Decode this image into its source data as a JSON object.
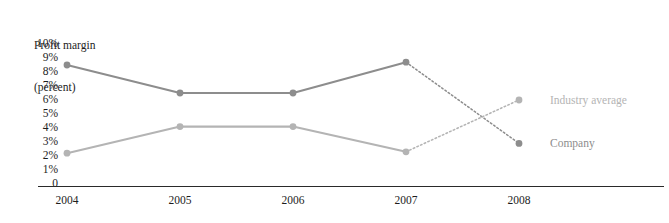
{
  "chart_data": {
    "type": "line",
    "title": "",
    "ylabel_lines": [
      "Profit margin",
      "(percent)"
    ],
    "xlabel": "",
    "categories": [
      "2004",
      "2005",
      "2006",
      "2007",
      "2008"
    ],
    "x": [
      2004,
      2005,
      2006,
      2007,
      2008
    ],
    "ylim": [
      0,
      10
    ],
    "ytick_labels": [
      "10%",
      "9%",
      "8%",
      "7%",
      "6%",
      "5%",
      "4%",
      "3%",
      "2%",
      "1%",
      "0"
    ],
    "ytick_values": [
      10,
      9,
      8,
      7,
      6,
      5,
      4,
      3,
      2,
      1,
      0
    ],
    "grid": false,
    "legend_position": "right-of-plot-inline",
    "series": [
      {
        "name": "Company",
        "label": "Company",
        "color": "#8d8d8d",
        "values": [
          8.5,
          6.5,
          6.5,
          8.7,
          2.9
        ],
        "dashed_from_index": 3,
        "note": "segment 2007-2008 drawn dotted (projected)"
      },
      {
        "name": "Industry average",
        "label": "Industry average",
        "color": "#b4b4b4",
        "values": [
          2.2,
          4.1,
          4.1,
          2.3,
          6.0
        ],
        "dashed_from_index": 3,
        "note": "segment 2007-2008 drawn dotted (projected)"
      }
    ],
    "annotations": []
  },
  "colors": {
    "company": "#8d8d8d",
    "industry": "#b4b4b4",
    "axis": "#2a2a2a",
    "text": "#1d1d1d",
    "background": "#ffffff"
  }
}
